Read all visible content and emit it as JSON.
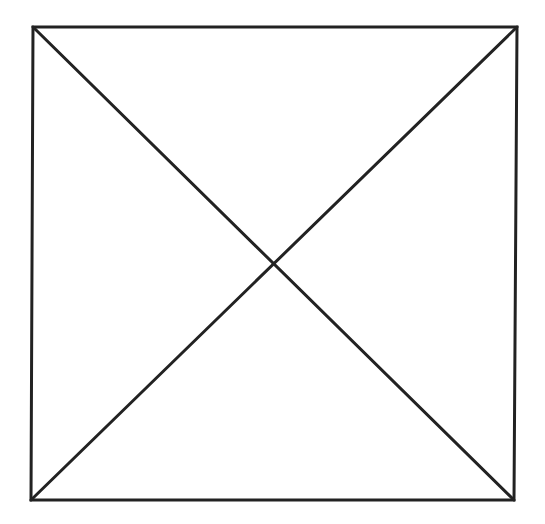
{
  "page": {
    "corner_label": "",
    "background": "#ffffff"
  },
  "diagram": {
    "type": "square-with-diagonals",
    "stroke_color": "#222222",
    "stroke_width": 3,
    "square": {
      "top_left": [
        33,
        27
      ],
      "top_right": [
        517,
        27
      ],
      "bottom_right": [
        514,
        500
      ],
      "bottom_left": [
        31,
        500
      ]
    },
    "diagonals": [
      {
        "from": "top_left",
        "to": "bottom_right"
      },
      {
        "from": "top_right",
        "to": "bottom_left"
      }
    ],
    "intersection": [
      272,
      262
    ]
  }
}
